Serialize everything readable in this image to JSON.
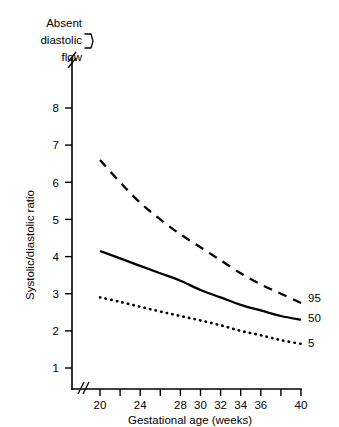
{
  "chart_data": {
    "type": "line",
    "title": "",
    "xlabel": "Gestational age (weeks)",
    "ylabel": "Systolic/diastolic ratio",
    "xlim": [
      20,
      40
    ],
    "ylim": [
      0,
      8.6
    ],
    "grid": false,
    "legend_position": "right-end-of-curves",
    "x_ticks": [
      20,
      22,
      24,
      26,
      28,
      30,
      32,
      34,
      36,
      38,
      40
    ],
    "x_tick_labels": [
      "20",
      "",
      "24",
      "",
      "28",
      "30",
      "32",
      "34",
      "36",
      "",
      "40"
    ],
    "y_ticks": [
      1,
      2,
      3,
      4,
      5,
      6,
      7,
      8
    ],
    "y_tick_labels": [
      "1",
      "2",
      "3",
      "4",
      "5",
      "6",
      "7",
      "8"
    ],
    "axis_breaks": {
      "x_axis_break": "//",
      "y_axis_break": "//"
    },
    "annotations": [
      {
        "name": "absent-diastolic-flow",
        "lines": [
          "Absent",
          "diastolic",
          "flow"
        ],
        "marker": "bracket"
      }
    ],
    "x": [
      20,
      22,
      24,
      26,
      28,
      30,
      32,
      34,
      36,
      38,
      40
    ],
    "series": [
      {
        "name": "95",
        "label": "95",
        "style": "dashed",
        "values": [
          6.6,
          6.0,
          5.45,
          5.0,
          4.6,
          4.25,
          3.9,
          3.55,
          3.25,
          3.0,
          2.75
        ]
      },
      {
        "name": "50",
        "label": "50",
        "style": "solid",
        "values": [
          4.15,
          3.95,
          3.75,
          3.55,
          3.35,
          3.1,
          2.9,
          2.7,
          2.55,
          2.4,
          2.3
        ]
      },
      {
        "name": "5",
        "label": "5",
        "style": "dotted",
        "values": [
          2.9,
          2.78,
          2.65,
          2.52,
          2.4,
          2.28,
          2.15,
          2.0,
          1.88,
          1.75,
          1.65
        ]
      }
    ]
  },
  "axes": {
    "x_title": "Gestational age (weeks)",
    "y_title": "Systolic/diastolic ratio"
  },
  "note": {
    "line1": "Absent",
    "line2": "diastolic",
    "line3": "flow"
  },
  "series_labels": {
    "p95": "95",
    "p50": "50",
    "p5": "5"
  },
  "y_tick_labels": {
    "t1": "1",
    "t2": "2",
    "t3": "3",
    "t4": "4",
    "t5": "5",
    "t6": "6",
    "t7": "7",
    "t8": "8"
  },
  "x_tick_labels": {
    "t20": "20",
    "t24": "24",
    "t28": "28",
    "t30": "30",
    "t32": "32",
    "t34": "34",
    "t36": "36",
    "t40": "40"
  }
}
